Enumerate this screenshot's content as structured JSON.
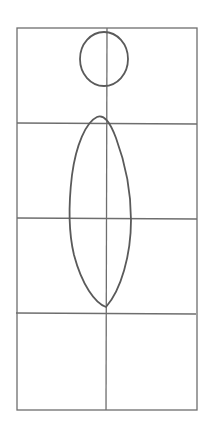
{
  "sketch": {
    "description": "Pencil sketch of a figure construction grid: circle head and elongated oval body on a 2x4 grid",
    "stroke_color": "#6e6e6e",
    "figure_stroke_color": "#5a5a5a",
    "background": "#ffffff",
    "grid": {
      "left": 17,
      "right": 197,
      "top": 28,
      "bottom": 410,
      "center_x": 107,
      "rows": [
        123,
        218,
        313
      ]
    },
    "head": {
      "cx": 104,
      "cy": 59,
      "r": 25
    },
    "body": {
      "cx": 100,
      "cy": 212,
      "rx": 31,
      "ry": 95
    }
  }
}
